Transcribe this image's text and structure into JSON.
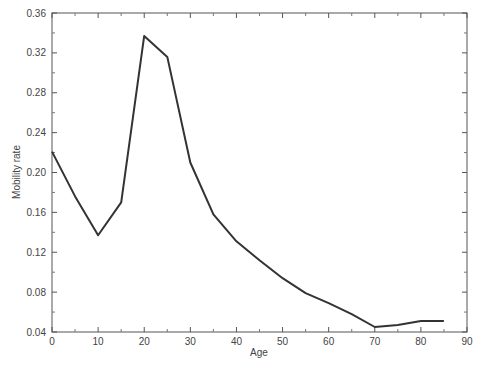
{
  "chart_data": {
    "type": "line",
    "title": "",
    "xlabel": "Age",
    "ylabel": "Mobility rate",
    "xlim": [
      0,
      90
    ],
    "ylim": [
      0.04,
      0.36
    ],
    "xticks": [
      0,
      10,
      20,
      30,
      40,
      50,
      60,
      70,
      80,
      90
    ],
    "yticks": [
      0.04,
      0.08,
      0.12,
      0.16,
      0.2,
      0.24,
      0.28,
      0.32,
      0.36
    ],
    "ytick_labels": [
      "0.04",
      "0.08",
      "0.12",
      "0.16",
      "0.20",
      "0.24",
      "0.28",
      "0.32",
      "0.36"
    ],
    "grid": false,
    "legend": null,
    "series": [
      {
        "name": "Mobility rate",
        "color": "#333333",
        "x": [
          0,
          5,
          10,
          15,
          20,
          25,
          30,
          35,
          40,
          45,
          50,
          55,
          60,
          65,
          70,
          75,
          80,
          85
        ],
        "y": [
          0.221,
          0.176,
          0.137,
          0.17,
          0.337,
          0.316,
          0.21,
          0.158,
          0.131,
          0.112,
          0.094,
          0.079,
          0.069,
          0.058,
          0.045,
          0.047,
          0.051,
          0.051
        ]
      }
    ]
  }
}
